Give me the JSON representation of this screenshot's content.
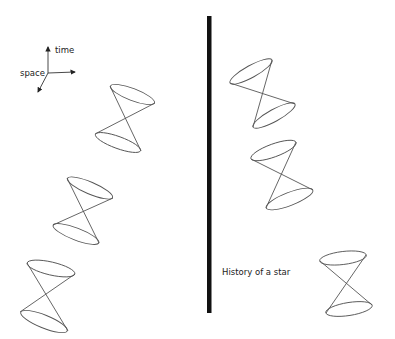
{
  "figure": {
    "width": 395,
    "height": 339,
    "background": "#ffffff",
    "stroke_color": "#555555",
    "bar_color": "#111111"
  },
  "axes": {
    "time_label": "time",
    "space_label": "space",
    "origin": [
      48,
      73
    ],
    "time_tip": [
      48,
      46
    ],
    "space_right_tip": [
      76,
      72
    ],
    "space_depth_tip": [
      37,
      93
    ]
  },
  "divider": {
    "x": 209,
    "y_top": 16,
    "y_bottom": 313,
    "width": 4.5
  },
  "caption": {
    "text": "History of a star"
  },
  "left_cones": [
    {
      "top": [
        [
          110,
          86
        ],
        [
          155,
          103
        ]
      ],
      "apex": [
        124,
        118
      ],
      "bottom": [
        [
          95,
          134
        ],
        [
          141,
          151
        ]
      ]
    },
    {
      "top": [
        [
          67,
          178
        ],
        [
          113,
          198
        ]
      ],
      "apex": [
        83,
        211
      ],
      "bottom": [
        [
          53,
          225
        ],
        [
          99,
          243
        ]
      ]
    },
    {
      "top": [
        [
          27,
          263
        ],
        [
          75,
          274
        ]
      ],
      "apex": [
        48,
        290
      ],
      "bottom": [
        [
          20,
          312
        ],
        [
          68,
          331
        ]
      ]
    }
  ],
  "right_cones": [
    {
      "top": [
        [
          230,
          83
        ],
        [
          272,
          60
        ]
      ],
      "apex": [
        262,
        93
      ],
      "bottom": [
        [
          253,
          127
        ],
        [
          295,
          104
        ]
      ]
    },
    {
      "top": [
        [
          251,
          159
        ],
        [
          296,
          142
        ]
      ],
      "apex": [
        281,
        174
      ],
      "bottom": [
        [
          266,
          208
        ],
        [
          313,
          190
        ]
      ]
    },
    {
      "top": [
        [
          320,
          261
        ],
        [
          366,
          255
        ]
      ],
      "apex": [
        345,
        284
      ],
      "bottom": [
        [
          326,
          313
        ],
        [
          372,
          305
        ]
      ]
    }
  ]
}
